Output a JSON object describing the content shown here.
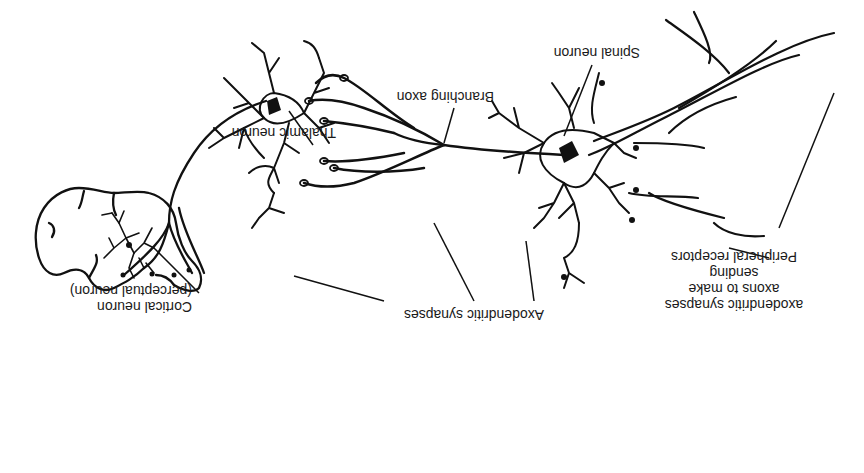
{
  "diagram": {
    "orientation": "rotated 180 degrees",
    "labels": {
      "spinal_neuron": "Spinal neuron",
      "branching_axon": "Branching axon",
      "thalamic_neuron": "Thalamic neuron",
      "axodendritic_synapses": "Axodendritic synapses",
      "cortical_neuron": "Cortical neuron",
      "cortical_neuron_sub": "(perceptual neuron)",
      "peripheral_line1": "Peripheral receptors",
      "peripheral_line2": "sending",
      "peripheral_line3": "axons to make",
      "peripheral_line4": "axodendritic synapses"
    },
    "colors": {
      "ink": "#111111",
      "background": "#ffffff"
    }
  }
}
